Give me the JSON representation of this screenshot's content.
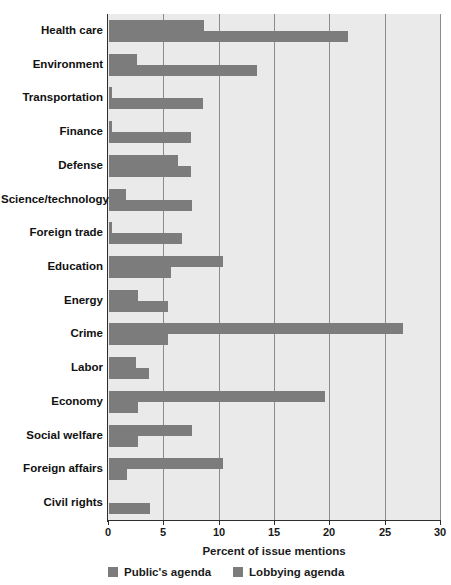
{
  "chart_data": {
    "type": "bar",
    "orientation": "horizontal",
    "title": "",
    "xlabel": "Percent of issue mentions",
    "ylabel": "",
    "xlim": [
      0,
      30
    ],
    "xticks": [
      0,
      5,
      10,
      15,
      20,
      25,
      30
    ],
    "grid": true,
    "legend_position": "bottom-left",
    "categories": [
      "Health care",
      "Environment",
      "Transportation",
      "Finance",
      "Defense",
      "Science/technology",
      "Foreign trade",
      "Education",
      "Energy",
      "Crime",
      "Labor",
      "Economy",
      "Social welfare",
      "Foreign affairs",
      "Civil  rights"
    ],
    "series": [
      {
        "name": "Public's agenda",
        "color": "#7c7c7c",
        "values": [
          8.6,
          2.5,
          0.3,
          0.3,
          6.2,
          1.5,
          0.3,
          10.3,
          2.6,
          26.6,
          2.4,
          19.5,
          7.5,
          10.3,
          0.0
        ]
      },
      {
        "name": "Lobbying agenda",
        "color": "#7c7c7c",
        "values": [
          21.6,
          13.4,
          8.5,
          7.4,
          7.4,
          7.5,
          6.6,
          5.6,
          5.3,
          5.3,
          3.6,
          2.6,
          2.6,
          1.6,
          3.7
        ]
      }
    ]
  },
  "axis": {
    "tick_labels": [
      "0",
      "5",
      "10",
      "15",
      "20",
      "25",
      "30"
    ],
    "x_title": "Percent of issue mentions"
  },
  "legend": {
    "items": [
      {
        "label": "Public's agenda"
      },
      {
        "label": "Lobbying agenda"
      }
    ]
  },
  "colors": {
    "bar": "#7c7c7c",
    "plot_background": "#eaeaea",
    "gridline": "#8c8c8c",
    "axis": "#2e2e2e",
    "text": "#111111"
  }
}
